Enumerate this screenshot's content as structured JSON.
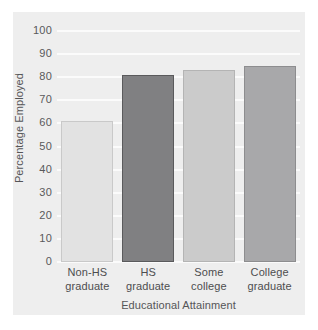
{
  "chart_data": {
    "type": "bar",
    "title": "",
    "subtitle": "",
    "xlabel": "Educational Attainment",
    "ylabel": "Percentage Employed",
    "categories": [
      "Non-HS graduate",
      "HS graduate",
      "Some college",
      "College graduate"
    ],
    "category_lines": [
      [
        "Non-HS",
        "graduate"
      ],
      [
        "HS",
        "graduate"
      ],
      [
        "Some",
        "college"
      ],
      [
        "College",
        "graduate"
      ]
    ],
    "values": [
      61,
      81,
      83,
      85
    ],
    "bar_colors": [
      "#e2e2e2",
      "#808082",
      "#cbcbcb",
      "#a8a8aa"
    ],
    "bar_edge_colors": [
      "#c9c9c9",
      "#5a5a5c",
      "#b4b4b4",
      "#8d8d8f"
    ],
    "ylim": [
      0,
      100
    ],
    "yticks": [
      0,
      10,
      20,
      30,
      40,
      50,
      60,
      70,
      80,
      90,
      100
    ],
    "ytick_labels": [
      "0",
      "10",
      "20",
      "30",
      "40",
      "50",
      "60",
      "70",
      "80",
      "90",
      "100"
    ],
    "grid": true,
    "grid_axis": "y",
    "grid_color": "#fbfbfb",
    "legend": null,
    "legend_position": "none",
    "panel_background": "#eeeeee",
    "figure_background": "#ffffff",
    "annotations": []
  }
}
